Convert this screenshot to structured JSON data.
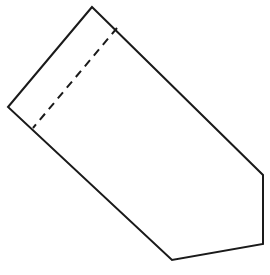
{
  "diagram": {
    "stroke_color": "#1a1a1a",
    "background": "#ffffff",
    "outline_points": "92,7 8,107 172,260 263,244 263,175",
    "dashed_line": {
      "x1": 117,
      "y1": 28,
      "x2": 33,
      "y2": 128
    }
  }
}
